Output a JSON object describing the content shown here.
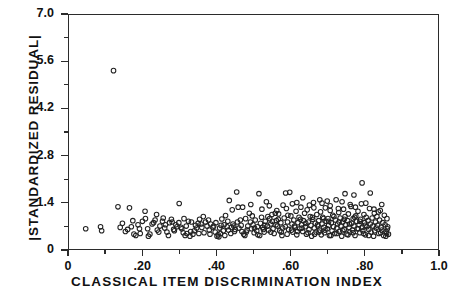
{
  "chart_data": {
    "type": "scatter",
    "title": "",
    "xlabel": "CLASSICAL ITEM DISCRIMINATION INDEX",
    "ylabel": "|STANDARDIZED RESIDUAL|",
    "xlim": [
      0,
      1.0
    ],
    "ylim": [
      0,
      7.0
    ],
    "grid": false,
    "legend": null,
    "marker": "open-circle",
    "marker_color": "#222222",
    "marker_size_px": 4.6,
    "xticks_major": [
      0,
      0.2,
      0.4,
      0.6,
      0.8,
      1.0
    ],
    "xticks_major_labels": [
      "0",
      ".20",
      ".40",
      ".60",
      ".80",
      "1.0"
    ],
    "xticks_minor": [
      0.1,
      0.3,
      0.5,
      0.7,
      0.9
    ],
    "yticks_major": [
      0,
      1.4,
      2.8,
      4.2,
      5.6,
      7.0
    ],
    "yticks_major_labels": [
      "0",
      "1.4",
      "2.8",
      "4.2",
      "5.6",
      "7.0"
    ],
    "yticks_minor": [
      0.7,
      2.1,
      3.5,
      4.9,
      6.3
    ],
    "n_points": 312,
    "annotations": [
      {
        "text": "outlier",
        "x": 0.12,
        "y": 5.35
      }
    ],
    "points": [
      [
        0.045,
        0.66
      ],
      [
        0.085,
        0.72
      ],
      [
        0.088,
        0.6
      ],
      [
        0.12,
        5.35
      ],
      [
        0.132,
        1.31
      ],
      [
        0.138,
        0.7
      ],
      [
        0.152,
        0.58
      ],
      [
        0.163,
        1.28
      ],
      [
        0.168,
        0.72
      ],
      [
        0.175,
        0.5
      ],
      [
        0.186,
        0.78
      ],
      [
        0.192,
        0.52
      ],
      [
        0.198,
        0.88
      ],
      [
        0.205,
        1.18
      ],
      [
        0.212,
        0.66
      ],
      [
        0.218,
        0.5
      ],
      [
        0.224,
        0.8
      ],
      [
        0.232,
        0.92
      ],
      [
        0.238,
        0.62
      ],
      [
        0.245,
        0.74
      ],
      [
        0.252,
        0.88
      ],
      [
        0.258,
        0.68
      ],
      [
        0.264,
        0.56
      ],
      [
        0.271,
        0.84
      ],
      [
        0.278,
        0.86
      ],
      [
        0.284,
        0.6
      ],
      [
        0.291,
        0.72
      ],
      [
        0.297,
        1.41
      ],
      [
        0.302,
        0.7
      ],
      [
        0.308,
        0.54
      ],
      [
        0.313,
        0.46
      ],
      [
        0.318,
        0.52
      ],
      [
        0.322,
        0.88
      ],
      [
        0.328,
        0.58
      ],
      [
        0.334,
        0.5
      ],
      [
        0.341,
        0.76
      ],
      [
        0.348,
        0.82
      ],
      [
        0.352,
        0.94
      ],
      [
        0.358,
        0.7
      ],
      [
        0.362,
        1.02
      ],
      [
        0.368,
        0.86
      ],
      [
        0.372,
        0.74
      ],
      [
        0.378,
        0.62
      ],
      [
        0.382,
        0.8
      ],
      [
        0.388,
        0.7
      ],
      [
        0.394,
        0.56
      ],
      [
        0.399,
        0.44
      ],
      [
        0.402,
        0.48
      ],
      [
        0.404,
        0.42
      ],
      [
        0.408,
        0.52
      ],
      [
        0.412,
        0.95
      ],
      [
        0.418,
        0.78
      ],
      [
        0.422,
        1.05
      ],
      [
        0.428,
        0.88
      ],
      [
        0.432,
        1.5
      ],
      [
        0.438,
        0.7
      ],
      [
        0.442,
        0.8
      ],
      [
        0.448,
        0.64
      ],
      [
        0.452,
        1.75
      ],
      [
        0.456,
        1.3
      ],
      [
        0.462,
        0.92
      ],
      [
        0.466,
        0.58
      ],
      [
        0.471,
        0.5
      ],
      [
        0.474,
        0.46
      ],
      [
        0.478,
        0.56
      ],
      [
        0.482,
        0.74
      ],
      [
        0.486,
        1.12
      ],
      [
        0.489,
        0.86
      ],
      [
        0.492,
        0.66
      ],
      [
        0.496,
        0.78
      ],
      [
        0.499,
        0.54
      ],
      [
        0.502,
        0.92
      ],
      [
        0.506,
        0.6
      ],
      [
        0.509,
        0.48
      ],
      [
        0.512,
        1.7
      ],
      [
        0.516,
        0.82
      ],
      [
        0.519,
        1.0
      ],
      [
        0.522,
        0.7
      ],
      [
        0.526,
        0.56
      ],
      [
        0.529,
        0.88
      ],
      [
        0.532,
        1.46
      ],
      [
        0.535,
        0.74
      ],
      [
        0.538,
        0.62
      ],
      [
        0.541,
        0.96
      ],
      [
        0.544,
        0.8
      ],
      [
        0.547,
        1.08
      ],
      [
        0.55,
        0.66
      ],
      [
        0.553,
        0.52
      ],
      [
        0.556,
        1.12
      ],
      [
        0.559,
        0.9
      ],
      [
        0.562,
        0.74
      ],
      [
        0.565,
        1.1
      ],
      [
        0.568,
        0.6
      ],
      [
        0.571,
        0.84
      ],
      [
        0.574,
        0.46
      ],
      [
        0.577,
        1.36
      ],
      [
        0.58,
        0.98
      ],
      [
        0.583,
        0.72
      ],
      [
        0.586,
        1.26
      ],
      [
        0.589,
        0.86
      ],
      [
        0.592,
        0.64
      ],
      [
        0.595,
        1.74
      ],
      [
        0.598,
        1.04
      ],
      [
        0.601,
        0.8
      ],
      [
        0.603,
        0.56
      ],
      [
        0.606,
        0.92
      ],
      [
        0.609,
        0.7
      ],
      [
        0.612,
        1.18
      ],
      [
        0.614,
        0.48
      ],
      [
        0.617,
        0.84
      ],
      [
        0.62,
        1.0
      ],
      [
        0.622,
        0.66
      ],
      [
        0.625,
        1.3
      ],
      [
        0.627,
        0.78
      ],
      [
        0.63,
        0.58
      ],
      [
        0.632,
        0.9
      ],
      [
        0.635,
        1.12
      ],
      [
        0.637,
        0.72
      ],
      [
        0.64,
        0.5
      ],
      [
        0.642,
        1.22
      ],
      [
        0.645,
        0.86
      ],
      [
        0.647,
        0.64
      ],
      [
        0.65,
        1.02
      ],
      [
        0.652,
        0.76
      ],
      [
        0.654,
        0.44
      ],
      [
        0.657,
        0.94
      ],
      [
        0.659,
        1.44
      ],
      [
        0.661,
        0.68
      ],
      [
        0.664,
        0.82
      ],
      [
        0.666,
        0.56
      ],
      [
        0.668,
        1.08
      ],
      [
        0.671,
        0.74
      ],
      [
        0.673,
        0.9
      ],
      [
        0.675,
        0.62
      ],
      [
        0.678,
        1.16
      ],
      [
        0.68,
        0.48
      ],
      [
        0.682,
        0.8
      ],
      [
        0.684,
        1.0
      ],
      [
        0.687,
        0.7
      ],
      [
        0.689,
        0.54
      ],
      [
        0.691,
        1.28
      ],
      [
        0.693,
        0.88
      ],
      [
        0.696,
        0.66
      ],
      [
        0.698,
        0.96
      ],
      [
        0.7,
        0.76
      ],
      [
        0.702,
        0.46
      ],
      [
        0.704,
        1.2
      ],
      [
        0.707,
        0.84
      ],
      [
        0.709,
        0.6
      ],
      [
        0.711,
        1.06
      ],
      [
        0.713,
        0.72
      ],
      [
        0.716,
        0.52
      ],
      [
        0.718,
        0.92
      ],
      [
        0.72,
        1.52
      ],
      [
        0.722,
        0.68
      ],
      [
        0.724,
        0.8
      ],
      [
        0.727,
        1.14
      ],
      [
        0.729,
        0.58
      ],
      [
        0.731,
        0.98
      ],
      [
        0.733,
        0.74
      ],
      [
        0.735,
        0.44
      ],
      [
        0.738,
        0.86
      ],
      [
        0.74,
        1.24
      ],
      [
        0.742,
        0.64
      ],
      [
        0.744,
        1.02
      ],
      [
        0.746,
        0.78
      ],
      [
        0.749,
        0.5
      ],
      [
        0.751,
        0.9
      ],
      [
        0.753,
        1.1
      ],
      [
        0.755,
        0.7
      ],
      [
        0.757,
        0.56
      ],
      [
        0.76,
        1.32
      ],
      [
        0.762,
        0.82
      ],
      [
        0.764,
        0.62
      ],
      [
        0.766,
        0.96
      ],
      [
        0.768,
        0.74
      ],
      [
        0.771,
        0.46
      ],
      [
        0.773,
        1.04
      ],
      [
        0.775,
        0.88
      ],
      [
        0.777,
        0.66
      ],
      [
        0.779,
        1.18
      ],
      [
        0.782,
        0.78
      ],
      [
        0.784,
        0.54
      ],
      [
        0.786,
        0.94
      ],
      [
        0.788,
        1.4
      ],
      [
        0.79,
        0.7
      ],
      [
        0.792,
        0.6
      ],
      [
        0.795,
        1.08
      ],
      [
        0.797,
        0.84
      ],
      [
        0.799,
        0.48
      ],
      [
        0.801,
        1.0
      ],
      [
        0.803,
        0.72
      ],
      [
        0.806,
        0.9
      ],
      [
        0.808,
        0.64
      ],
      [
        0.81,
        1.26
      ],
      [
        0.812,
        0.8
      ],
      [
        0.814,
        0.56
      ],
      [
        0.817,
        0.98
      ],
      [
        0.819,
        0.74
      ],
      [
        0.821,
        0.44
      ],
      [
        0.823,
        1.12
      ],
      [
        0.826,
        0.86
      ],
      [
        0.828,
        0.68
      ],
      [
        0.83,
        1.02
      ],
      [
        0.832,
        0.76
      ],
      [
        0.835,
        0.52
      ],
      [
        0.837,
        0.92
      ],
      [
        0.839,
        1.2
      ],
      [
        0.841,
        0.7
      ],
      [
        0.843,
        0.62
      ],
      [
        0.846,
        0.84
      ],
      [
        0.848,
        0.46
      ],
      [
        0.85,
        1.06
      ],
      [
        0.852,
        0.78
      ],
      [
        0.855,
        0.58
      ],
      [
        0.857,
        0.96
      ],
      [
        0.859,
        0.72
      ],
      [
        0.861,
        0.5
      ],
      [
        0.584,
        1.72
      ],
      [
        0.63,
        1.58
      ],
      [
        0.676,
        1.52
      ],
      [
        0.696,
        1.48
      ],
      [
        0.744,
        1.7
      ],
      [
        0.768,
        1.66
      ],
      [
        0.79,
        2.02
      ],
      [
        0.812,
        1.72
      ],
      [
        0.843,
        1.38
      ],
      [
        0.856,
        0.52
      ],
      [
        0.858,
        0.66
      ],
      [
        0.44,
        1.22
      ],
      [
        0.468,
        1.3
      ],
      [
        0.49,
        1.38
      ],
      [
        0.52,
        1.24
      ],
      [
        0.54,
        1.34
      ],
      [
        0.56,
        1.2
      ],
      [
        0.602,
        1.4
      ],
      [
        0.614,
        1.44
      ],
      [
        0.648,
        1.36
      ],
      [
        0.66,
        1.28
      ],
      [
        0.682,
        1.42
      ],
      [
        0.704,
        1.34
      ],
      [
        0.726,
        1.26
      ],
      [
        0.736,
        1.46
      ],
      [
        0.758,
        1.38
      ],
      [
        0.772,
        1.3
      ],
      [
        0.8,
        1.42
      ],
      [
        0.822,
        1.24
      ],
      [
        0.834,
        1.16
      ],
      [
        0.206,
        0.96
      ],
      [
        0.236,
        1.08
      ],
      [
        0.254,
        0.98
      ],
      [
        0.276,
        0.94
      ],
      [
        0.288,
        0.78
      ],
      [
        0.31,
        0.96
      ],
      [
        0.33,
        0.86
      ],
      [
        0.344,
        0.68
      ],
      [
        0.356,
        0.8
      ],
      [
        0.376,
        0.92
      ],
      [
        0.39,
        0.74
      ],
      [
        0.406,
        0.68
      ],
      [
        0.416,
        0.6
      ],
      [
        0.426,
        0.72
      ],
      [
        0.436,
        0.52
      ],
      [
        0.446,
        0.58
      ],
      [
        0.458,
        0.68
      ],
      [
        0.476,
        0.96
      ],
      [
        0.494,
        1.04
      ],
      [
        0.508,
        0.72
      ],
      [
        0.524,
        0.64
      ],
      [
        0.536,
        1.02
      ],
      [
        0.548,
        0.88
      ],
      [
        0.564,
        0.94
      ],
      [
        0.576,
        0.68
      ],
      [
        0.59,
        1.06
      ],
      [
        0.608,
        0.74
      ],
      [
        0.624,
        0.94
      ],
      [
        0.638,
        0.82
      ],
      [
        0.656,
        1.0
      ],
      [
        0.67,
        0.78
      ],
      [
        0.686,
        0.96
      ],
      [
        0.7,
        0.88
      ],
      [
        0.714,
        1.02
      ],
      [
        0.728,
        0.86
      ],
      [
        0.742,
        0.94
      ],
      [
        0.756,
        0.8
      ],
      [
        0.77,
        1.0
      ],
      [
        0.784,
        0.88
      ],
      [
        0.798,
        0.76
      ],
      [
        0.144,
        0.82
      ],
      [
        0.158,
        0.64
      ],
      [
        0.172,
        0.9
      ],
      [
        0.18,
        0.46
      ],
      [
        0.19,
        0.66
      ],
      [
        0.214,
        0.44
      ],
      [
        0.228,
        0.84
      ],
      [
        0.242,
        0.56
      ],
      [
        0.26,
        0.78
      ],
      [
        0.268,
        0.46
      ],
      [
        0.282,
        0.64
      ],
      [
        0.296,
        0.84
      ],
      [
        0.304,
        0.66
      ],
      [
        0.316,
        0.74
      ],
      [
        0.326,
        0.44
      ],
      [
        0.338,
        0.6
      ],
      [
        0.35,
        0.52
      ],
      [
        0.364,
        0.54
      ],
      [
        0.38,
        0.5
      ],
      [
        0.396,
        0.84
      ],
      [
        0.41,
        0.76
      ],
      [
        0.42,
        0.46
      ],
      [
        0.43,
        0.62
      ],
      [
        0.444,
        0.74
      ],
      [
        0.454,
        0.86
      ],
      [
        0.464,
        0.76
      ],
      [
        0.48,
        0.62
      ],
      [
        0.5,
        0.68
      ],
      [
        0.514,
        0.46
      ],
      [
        0.528,
        0.76
      ],
      [
        0.544,
        0.56
      ],
      [
        0.558,
        0.78
      ],
      [
        0.572,
        0.56
      ],
      [
        0.588,
        0.5
      ],
      [
        0.6,
        0.62
      ],
      [
        0.616,
        0.58
      ],
      [
        0.628,
        0.68
      ],
      [
        0.644,
        0.54
      ],
      [
        0.662,
        0.5
      ],
      [
        0.674,
        0.56
      ],
      [
        0.69,
        0.62
      ],
      [
        0.706,
        0.46
      ],
      [
        0.722,
        0.52
      ],
      [
        0.738,
        0.6
      ],
      [
        0.752,
        0.48
      ],
      [
        0.766,
        0.54
      ],
      [
        0.78,
        0.66
      ],
      [
        0.794,
        0.52
      ],
      [
        0.808,
        0.46
      ],
      [
        0.824,
        0.6
      ],
      [
        0.84,
        0.54
      ],
      [
        0.854,
        0.44
      ]
    ]
  }
}
